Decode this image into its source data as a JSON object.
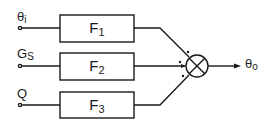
{
  "diagram": {
    "type": "block-diagram",
    "inputs": [
      {
        "symbol": "θ",
        "subscript": "i"
      },
      {
        "symbol": "G",
        "subscript": "S"
      },
      {
        "symbol": "Q",
        "subscript": ""
      }
    ],
    "blocks": [
      {
        "symbol": "F",
        "subscript": "1"
      },
      {
        "symbol": "F",
        "subscript": "2"
      },
      {
        "symbol": "F",
        "subscript": "3"
      }
    ],
    "junction": {
      "type": "summing-junction",
      "signs": [
        "+",
        "+",
        "+"
      ]
    },
    "output": {
      "symbol": "θ",
      "subscript": "o"
    },
    "colors": {
      "line": "#1a1a1a",
      "background": "#ffffff"
    }
  }
}
